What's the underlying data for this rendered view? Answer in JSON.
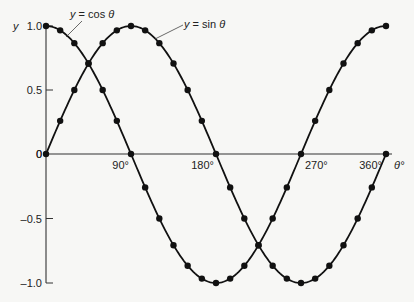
{
  "chart_data": {
    "type": "line",
    "title": "",
    "xlabel": "θ°",
    "ylabel": "y",
    "x_unit": "degrees",
    "xlim": [
      0,
      360
    ],
    "ylim": [
      -1.0,
      1.0
    ],
    "x_ticks": [
      {
        "value": 90,
        "label": "90°"
      },
      {
        "value": 180,
        "label": "180°"
      },
      {
        "value": 270,
        "label": "270°"
      },
      {
        "value": 360,
        "label": "360°"
      }
    ],
    "y_ticks": [
      {
        "value": 1.0,
        "label": "1.0"
      },
      {
        "value": 0.5,
        "label": "0.5"
      },
      {
        "value": 0,
        "label": "0"
      },
      {
        "value": -0.5,
        "label": "-0.5"
      },
      {
        "value": -1.0,
        "label": "-1.0"
      }
    ],
    "grid": false,
    "x": [
      0,
      15,
      30,
      45,
      60,
      75,
      90,
      105,
      120,
      135,
      150,
      165,
      180,
      195,
      210,
      225,
      240,
      255,
      270,
      285,
      300,
      315,
      330,
      345,
      360
    ],
    "series": [
      {
        "name": "y = sin θ",
        "values": [
          0,
          0.259,
          0.5,
          0.707,
          0.866,
          0.966,
          1,
          0.966,
          0.866,
          0.707,
          0.5,
          0.259,
          0,
          -0.259,
          -0.5,
          -0.707,
          -0.866,
          -0.966,
          -1,
          -0.966,
          -0.866,
          -0.707,
          -0.5,
          -0.259,
          0
        ]
      },
      {
        "name": "y = cos θ",
        "values": [
          1,
          0.966,
          0.866,
          0.707,
          0.5,
          0.259,
          0,
          -0.259,
          -0.5,
          -0.707,
          -0.866,
          -0.966,
          -1,
          -0.966,
          -0.866,
          -0.707,
          -0.5,
          -0.259,
          0,
          0.259,
          0.5,
          0.707,
          0.866,
          0.966,
          1
        ]
      }
    ],
    "annotations": [
      {
        "text": "y = cos θ",
        "points_to": "cos curve near θ≈20°"
      },
      {
        "text": "y = sin θ",
        "points_to": "sin curve near θ≈120°"
      }
    ],
    "markers": "filled circles at every 15°"
  },
  "labels": {
    "y_axis": "y",
    "x_axis": "θ°",
    "cos_label": "y = cos θ",
    "sin_label": "y = sin θ",
    "origin": "0"
  }
}
